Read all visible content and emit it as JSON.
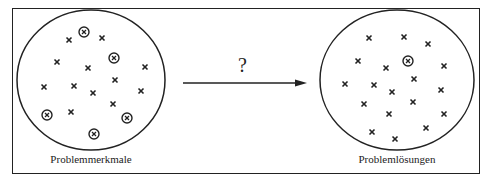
{
  "diagram": {
    "left": {
      "label": "Problemmerkmale",
      "cx": 91,
      "cy": 80,
      "rx": 74,
      "ry": 70,
      "cross_marks": [
        [
          69,
          40
        ],
        [
          102,
          38
        ],
        [
          57,
          62
        ],
        [
          88,
          68
        ],
        [
          145,
          67
        ],
        [
          44,
          87
        ],
        [
          74,
          86
        ],
        [
          93,
          93
        ],
        [
          115,
          80
        ],
        [
          141,
          91
        ],
        [
          113,
          104
        ],
        [
          71,
          112
        ]
      ],
      "circled_marks": [
        [
          84,
          32
        ],
        [
          114,
          58
        ],
        [
          47,
          115
        ],
        [
          127,
          118
        ],
        [
          94,
          134
        ]
      ]
    },
    "right": {
      "label": "Problemlösungen",
      "cx": 397,
      "cy": 80,
      "rx": 77,
      "ry": 70,
      "cross_marks": [
        [
          369,
          38
        ],
        [
          404,
          37
        ],
        [
          428,
          44
        ],
        [
          358,
          61
        ],
        [
          386,
          68
        ],
        [
          444,
          66
        ],
        [
          345,
          84
        ],
        [
          374,
          85
        ],
        [
          392,
          92
        ],
        [
          414,
          79
        ],
        [
          441,
          90
        ],
        [
          364,
          104
        ],
        [
          413,
          102
        ],
        [
          389,
          114
        ],
        [
          444,
          114
        ],
        [
          372,
          132
        ],
        [
          426,
          128
        ],
        [
          395,
          139
        ]
      ],
      "circled_marks": [
        [
          408,
          61
        ]
      ]
    },
    "arrow": {
      "label": "?",
      "x1": 183,
      "y1": 83,
      "x2": 307,
      "y2": 83
    }
  }
}
